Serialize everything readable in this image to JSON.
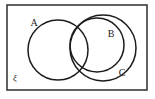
{
  "diagram": {
    "kind": "venn-diagram",
    "background_color": "#ffffff",
    "stroke_color": "#1c1c1c",
    "frame_color": "#3a3a3a",
    "universe": {
      "label": "ξ",
      "label_x": 15,
      "label_y": 79,
      "rect": {
        "x": 7,
        "y": 5,
        "width": 140,
        "height": 85
      }
    },
    "sets": [
      {
        "name": "A",
        "label": "A",
        "label_x": 34,
        "label_y": 24,
        "cx": 58,
        "cy": 50,
        "r": 30
      },
      {
        "name": "B",
        "label": "B",
        "label_x": 111,
        "label_y": 35,
        "cx": 97,
        "cy": 45,
        "r": 27
      },
      {
        "name": "C",
        "label": "C",
        "label_x": 122,
        "label_y": 74,
        "cx": 103,
        "cy": 48,
        "r": 33
      }
    ]
  }
}
